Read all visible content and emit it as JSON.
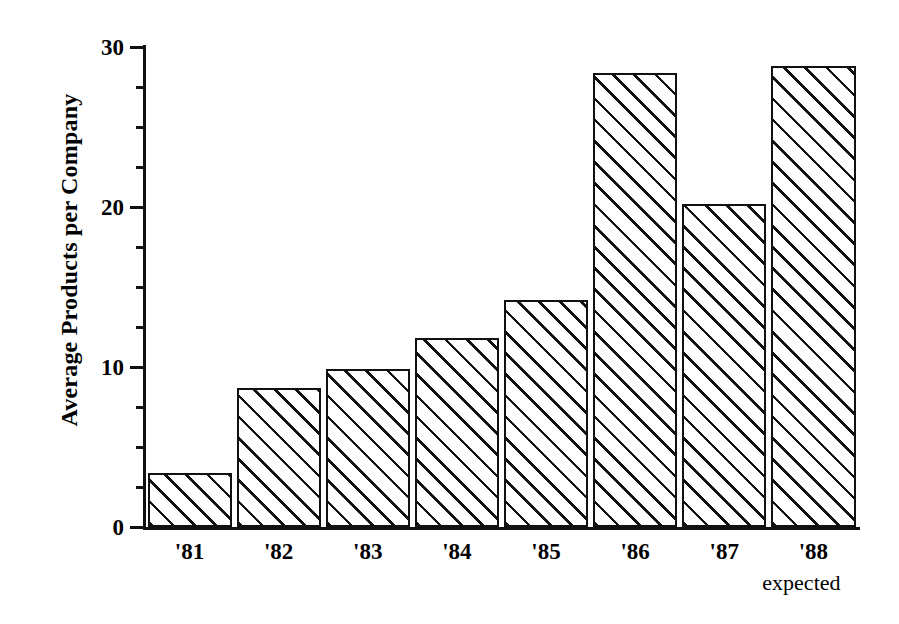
{
  "chart_data": {
    "type": "bar",
    "title": "",
    "subtitle": "",
    "xlabel": "",
    "ylabel": "Average Products per Company",
    "categories": [
      "'81",
      "'82",
      "'83",
      "'84",
      "'85",
      "'86",
      "'87",
      "'88"
    ],
    "values": [
      3.4,
      8.7,
      9.9,
      11.8,
      14.2,
      28.4,
      20.2,
      28.8
    ],
    "ylim": [
      0,
      30
    ],
    "xlim_note": "categorical, 8 contiguous bars",
    "y_major_ticks": [
      0,
      10,
      20,
      30
    ],
    "y_major_tick_labels": [
      "0",
      "10",
      "20",
      "30"
    ],
    "y_minor_ticks": [
      2.5,
      5,
      7.5,
      12.5,
      15,
      17.5,
      22.5,
      25,
      27.5
    ],
    "grid": false,
    "legend": null,
    "annotations": [
      {
        "text": "expected",
        "attached_to": "'88",
        "position": "below-x-tick-label"
      }
    ],
    "style": {
      "fill": "diagonal-hatch-45",
      "bar_edge_color": "#111111",
      "bar_face_color": "#ffffff",
      "background": "#ffffff",
      "axis_color": "#111111"
    }
  },
  "axis": {
    "y_title": "Average Products per Company",
    "y_tick_labels": [
      "30",
      "20",
      "10",
      "0"
    ],
    "x_tick_labels": [
      "'81",
      "'82",
      "'83",
      "'84",
      "'85",
      "'86",
      "'87",
      "'88"
    ],
    "x_note": "expected"
  }
}
